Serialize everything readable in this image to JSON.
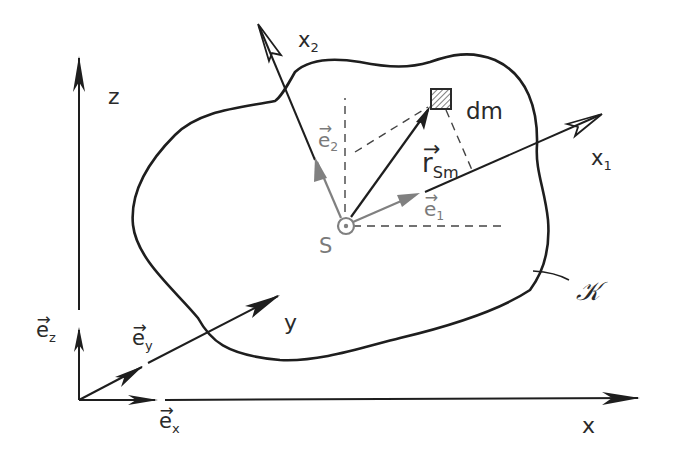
{
  "diagram": {
    "colors": {
      "ink": "#1e1e1e",
      "secondary": "#808080",
      "background": "#ffffff"
    },
    "global_axes": {
      "x": {
        "label": "x"
      },
      "y": {
        "label": "y"
      },
      "z": {
        "label": "z"
      }
    },
    "global_unit_vectors": {
      "ex": {
        "base": "e",
        "sub": "x"
      },
      "ey": {
        "base": "e",
        "sub": "y"
      },
      "ez": {
        "base": "e",
        "sub": "z"
      }
    },
    "body_axes": {
      "x1": {
        "base": "x",
        "sub": "1"
      },
      "x2": {
        "base": "x",
        "sub": "2"
      }
    },
    "body_unit_vectors": {
      "e1": {
        "base": "e",
        "sub": "1"
      },
      "e2": {
        "base": "e",
        "sub": "2"
      }
    },
    "center_of_mass": {
      "label": "S",
      "symbol": "circle-dot"
    },
    "mass_element": {
      "label": "dm",
      "symbol": "hatched-square"
    },
    "position_vector": {
      "base": "r",
      "sub": "Sm"
    },
    "body": {
      "label": "𝒦"
    }
  }
}
